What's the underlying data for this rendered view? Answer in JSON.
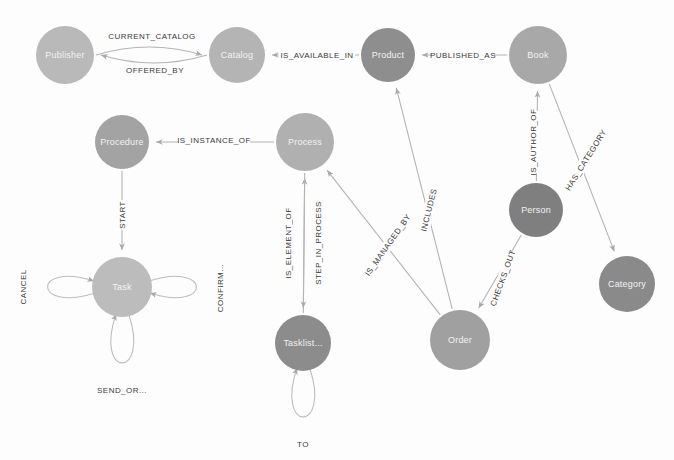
{
  "graph": {
    "type": "node-link-graph",
    "background_color": "#fdfdfd",
    "edge_color": "#b4b4b4",
    "nodes": [
      {
        "id": "publisher",
        "label": "Publisher",
        "x": 65,
        "y": 55,
        "r": 29,
        "color": "#b9b9b9"
      },
      {
        "id": "catalog",
        "label": "Catalog",
        "x": 237,
        "y": 55,
        "r": 28,
        "color": "#b4b4b4"
      },
      {
        "id": "product",
        "label": "Product",
        "x": 388,
        "y": 55,
        "r": 27,
        "color": "#8e8e8e"
      },
      {
        "id": "book",
        "label": "Book",
        "x": 538,
        "y": 55,
        "r": 29,
        "color": "#a8a8a8"
      },
      {
        "id": "procedure",
        "label": "Procedure",
        "x": 122,
        "y": 142,
        "r": 27,
        "color": "#a3a3a3"
      },
      {
        "id": "process",
        "label": "Process",
        "x": 305,
        "y": 142,
        "r": 29,
        "color": "#b0b0b0"
      },
      {
        "id": "person",
        "label": "Person",
        "x": 536,
        "y": 210,
        "r": 27,
        "color": "#7f7f7f"
      },
      {
        "id": "category",
        "label": "Category",
        "x": 627,
        "y": 284,
        "r": 28,
        "color": "#8a8a8a"
      },
      {
        "id": "task",
        "label": "Task",
        "x": 122,
        "y": 287,
        "r": 30,
        "color": "#bcbcbc"
      },
      {
        "id": "tasklist",
        "label": "Tasklist...",
        "x": 303,
        "y": 343,
        "r": 28,
        "color": "#8c8c8c"
      },
      {
        "id": "order",
        "label": "Order",
        "x": 460,
        "y": 340,
        "r": 30,
        "color": "#a0a0a0"
      }
    ],
    "edges": [
      {
        "id": "current-catalog",
        "label": "CURRENT_CATALOG",
        "source": "publisher",
        "target": "catalog",
        "label_x": 152,
        "label_y": 36,
        "rotate": 0
      },
      {
        "id": "offered-by",
        "label": "OFFERED_BY",
        "source": "catalog",
        "target": "publisher",
        "label_x": 155,
        "label_y": 70,
        "rotate": 0
      },
      {
        "id": "is-available-in",
        "label": "IS_AVAILABLE_IN",
        "source": "product",
        "target": "catalog",
        "label_x": 317,
        "label_y": 55,
        "rotate": 0
      },
      {
        "id": "published-as",
        "label": "PUBLISHED_AS",
        "source": "book",
        "target": "product",
        "label_x": 463,
        "label_y": 55,
        "rotate": 0
      },
      {
        "id": "is-instance-of",
        "label": "IS_INSTANCE_OF",
        "source": "process",
        "target": "procedure",
        "label_x": 214,
        "label_y": 140,
        "rotate": 0
      },
      {
        "id": "start",
        "label": "START",
        "source": "procedure",
        "target": "task",
        "label_x": 122,
        "label_y": 215,
        "rotate": -90
      },
      {
        "id": "is-author-of",
        "label": "IS_AUTHOR_OF",
        "source": "person",
        "target": "book",
        "label_x": 533,
        "label_y": 142,
        "rotate": -90
      },
      {
        "id": "has-category",
        "label": "HAS_CATEGORY",
        "source": "book",
        "target": "category",
        "label_x": 586,
        "label_y": 160,
        "rotate": -58
      },
      {
        "id": "checks-out",
        "label": "CHECKS_OUT",
        "source": "person",
        "target": "order",
        "label_x": 503,
        "label_y": 278,
        "rotate": -70
      },
      {
        "id": "includes",
        "label": "INCLUDES",
        "source": "order",
        "target": "product",
        "label_x": 429,
        "label_y": 210,
        "rotate": -76
      },
      {
        "id": "is-managed-by",
        "label": "IS_MANAGED_BY",
        "source": "order",
        "target": "process",
        "label_x": 388,
        "label_y": 245,
        "rotate": -55
      },
      {
        "id": "is-element-of",
        "label": "IS_ELEMENT_OF",
        "source": "tasklist",
        "target": "process",
        "label_x": 288,
        "label_y": 243,
        "rotate": -90
      },
      {
        "id": "step-in-process",
        "label": "STEP_IN_PROCESS",
        "source": "process",
        "target": "tasklist",
        "label_x": 318,
        "label_y": 243,
        "rotate": -90
      }
    ],
    "self_loops": [
      {
        "id": "cancel",
        "label": "CANCEL",
        "node": "task",
        "direction": "left",
        "label_x": 23,
        "label_y": 287,
        "rotate": -90
      },
      {
        "id": "confirm",
        "label": "CONFIRM...",
        "node": "task",
        "direction": "right",
        "label_x": 220,
        "label_y": 288,
        "rotate": -90
      },
      {
        "id": "send-or",
        "label": "SEND_OR...",
        "node": "task",
        "direction": "bottom",
        "label_x": 122,
        "label_y": 390,
        "rotate": 0
      },
      {
        "id": "to",
        "label": "TO",
        "node": "tasklist",
        "direction": "bottom",
        "label_x": 303,
        "label_y": 444,
        "rotate": 0
      }
    ]
  }
}
